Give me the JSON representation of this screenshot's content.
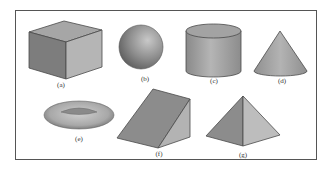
{
  "figure": {
    "frame": {
      "stroke": "#555555",
      "fill": "#ffffff"
    },
    "shapes": [
      {
        "id": "a",
        "name": "cube",
        "label": "(a)"
      },
      {
        "id": "b",
        "name": "sphere",
        "label": "(b)"
      },
      {
        "id": "c",
        "name": "cylinder",
        "label": "(c)"
      },
      {
        "id": "d",
        "name": "cone",
        "label": "(d)"
      },
      {
        "id": "e",
        "name": "torus",
        "label": "(e)"
      },
      {
        "id": "f",
        "name": "wedge",
        "label": "(f)"
      },
      {
        "id": "g",
        "name": "pyramid",
        "label": "(g)"
      }
    ],
    "colors": {
      "dark_face": "#7a7a7a",
      "mid_face": "#9a9a9a",
      "light_face": "#b8b8b8",
      "top_face": "#a6a6a6",
      "edge": "#4a4a4a"
    }
  }
}
